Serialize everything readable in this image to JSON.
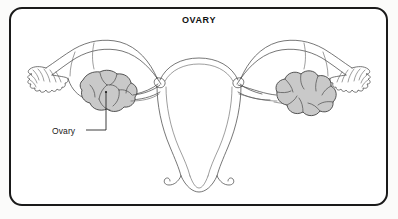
{
  "figure": {
    "title": "OVARY",
    "frame": {
      "border_color": "#1a1a1a",
      "background_color": "#ffffff",
      "corner_radius_px": 13
    },
    "page_background_color": "#fbfbfa",
    "view": "anterior coronal line drawing"
  },
  "labels": [
    {
      "id": "ovary",
      "text": "Ovary",
      "text_color": "#1a1a1a",
      "leader_line_color": "#1a1a1a",
      "points_to": "left ovary mass"
    }
  ],
  "structures": [
    {
      "name": "left-ovary",
      "fill_color": "#c9c9c9",
      "outline_color": "#3a3a3a",
      "shape": "lobulated mass"
    },
    {
      "name": "right-ovary",
      "fill_color": "#c9c9c9",
      "outline_color": "#3a3a3a",
      "shape": "lobulated cloud-like mass"
    },
    {
      "name": "uterus",
      "fill_color": "#ffffff",
      "outline_color": "#4a4a4a"
    },
    {
      "name": "left-fallopian-tube",
      "fill_color": "#ffffff",
      "outline_color": "#4a4a4a"
    },
    {
      "name": "right-fallopian-tube",
      "fill_color": "#ffffff",
      "outline_color": "#4a4a4a"
    },
    {
      "name": "left-fimbriae",
      "fill_color": "#ffffff",
      "outline_color": "#4a4a4a"
    },
    {
      "name": "right-fimbriae",
      "fill_color": "#ffffff",
      "outline_color": "#4a4a4a"
    },
    {
      "name": "cervix",
      "fill_color": "#ffffff",
      "outline_color": "#4a4a4a"
    }
  ]
}
